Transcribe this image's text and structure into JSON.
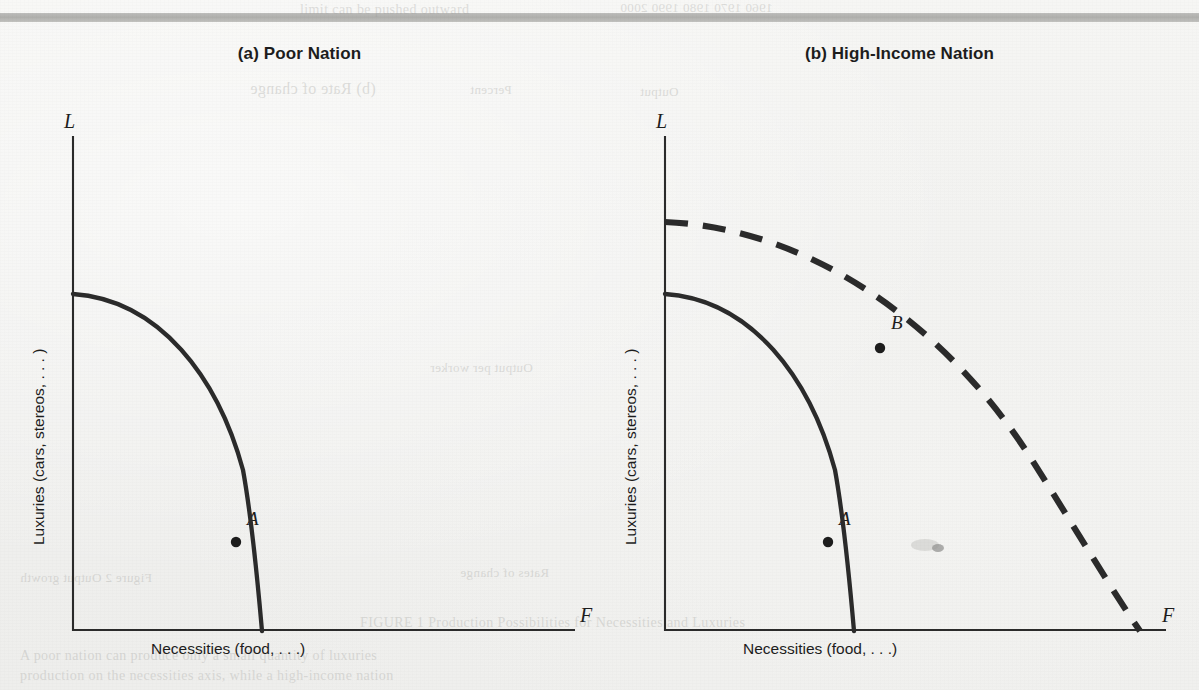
{
  "figure": {
    "kind": "production-possibilities-frontier",
    "background_color": "#f2f2f0",
    "ink_color": "#2b2b2b",
    "rule_color": "#b0b0ad"
  },
  "panels": [
    {
      "id": "a",
      "title": "(a) Poor Nation",
      "ylabel": "Luxuries (cars, stereos, . . . )",
      "xlabel": "Necessities (food, . . .)",
      "y_axis_letter": "L",
      "x_axis_letter": "F",
      "points": [
        {
          "label": "A",
          "on": "solid-curve"
        }
      ],
      "curves": [
        {
          "name": "current-ppf",
          "style": "solid"
        }
      ]
    },
    {
      "id": "b",
      "title": "(b) High-Income Nation",
      "ylabel": "Luxuries (cars, stereos, . . . )",
      "xlabel": "Necessities (food, . . .)",
      "y_axis_letter": "L",
      "x_axis_letter": "F",
      "points": [
        {
          "label": "A",
          "on": "solid-curve"
        },
        {
          "label": "B",
          "on": "dashed-curve"
        }
      ],
      "curves": [
        {
          "name": "current-ppf",
          "style": "solid"
        },
        {
          "name": "expanded-ppf",
          "style": "dashed"
        }
      ]
    }
  ],
  "chart_data": {
    "type": "line",
    "xlabel": "Necessities (food, . . .)",
    "ylabel": "Luxuries (cars, stereos, . . . )",
    "x_axis_symbol": "F",
    "y_axis_symbol": "L",
    "grid": false,
    "legend": "none",
    "xlim": [
      0,
      1
    ],
    "ylim": [
      0,
      1
    ],
    "panels": [
      {
        "panel": "(a) Poor Nation",
        "series": [
          {
            "name": "current-ppf",
            "style": "solid",
            "x_intercept": 0.42,
            "y_intercept": 0.66,
            "shape": "concave",
            "points_xy": [
              [
                0.0,
                0.66
              ],
              [
                0.06,
                0.655
              ],
              [
                0.12,
                0.64
              ],
              [
                0.18,
                0.61
              ],
              [
                0.24,
                0.565
              ],
              [
                0.3,
                0.5
              ],
              [
                0.355,
                0.4
              ],
              [
                0.39,
                0.29
              ],
              [
                0.41,
                0.16
              ],
              [
                0.42,
                0.0
              ]
            ]
          }
        ],
        "annotations": [
          {
            "label": "A",
            "x": 0.375,
            "y": 0.205,
            "marker": "filled-dot",
            "label_offset": "upper-right"
          }
        ]
      },
      {
        "panel": "(b) High-Income Nation",
        "series": [
          {
            "name": "current-ppf",
            "style": "solid",
            "x_intercept": 0.42,
            "y_intercept": 0.66,
            "shape": "concave",
            "points_xy": [
              [
                0.0,
                0.66
              ],
              [
                0.06,
                0.655
              ],
              [
                0.12,
                0.64
              ],
              [
                0.18,
                0.61
              ],
              [
                0.24,
                0.565
              ],
              [
                0.3,
                0.5
              ],
              [
                0.355,
                0.4
              ],
              [
                0.39,
                0.29
              ],
              [
                0.41,
                0.16
              ],
              [
                0.42,
                0.0
              ]
            ]
          },
          {
            "name": "expanded-ppf",
            "style": "dashed",
            "x_intercept": 0.99,
            "y_intercept": 0.8,
            "shape": "concave",
            "points_xy": [
              [
                0.0,
                0.8
              ],
              [
                0.12,
                0.79
              ],
              [
                0.24,
                0.765
              ],
              [
                0.36,
                0.72
              ],
              [
                0.48,
                0.655
              ],
              [
                0.6,
                0.575
              ],
              [
                0.72,
                0.47
              ],
              [
                0.82,
                0.355
              ],
              [
                0.9,
                0.235
              ],
              [
                0.96,
                0.1
              ],
              [
                0.99,
                0.0
              ]
            ]
          }
        ],
        "annotations": [
          {
            "label": "A",
            "x": 0.375,
            "y": 0.205,
            "marker": "filled-dot",
            "label_offset": "upper-right"
          },
          {
            "label": "B",
            "x": 0.465,
            "y": 0.565,
            "marker": "filled-dot",
            "label_offset": "upper-right"
          }
        ]
      }
    ]
  },
  "ghost_text": [
    {
      "text": "limit can be pushed outward",
      "x": 300,
      "y": 2,
      "size": 14,
      "flip": false
    },
    {
      "text": "1960 1970 1980 1990 2000",
      "x": 620,
      "y": 0,
      "size": 13,
      "flip": true
    },
    {
      "text": "(b) Rate of change",
      "x": 250,
      "y": 80,
      "size": 16,
      "flip": true
    },
    {
      "text": "Percent",
      "x": 470,
      "y": 82,
      "size": 13,
      "flip": true
    },
    {
      "text": "Output",
      "x": 640,
      "y": 84,
      "size": 13,
      "flip": true
    },
    {
      "text": "Output per worker",
      "x": 430,
      "y": 360,
      "size": 13,
      "flip": true
    },
    {
      "text": "Figure 2 Output growth",
      "x": 20,
      "y": 570,
      "size": 13,
      "flip": true
    },
    {
      "text": "Rates of change",
      "x": 460,
      "y": 565,
      "size": 13,
      "flip": true
    },
    {
      "text": "FIGURE 1  Production Possibilities for Necessities and Luxuries",
      "x": 360,
      "y": 615,
      "size": 14,
      "flip": false
    },
    {
      "text": "A poor nation can produce only a small quantity of luxuries",
      "x": 20,
      "y": 648,
      "size": 14,
      "flip": false
    },
    {
      "text": "production on the necessities axis, while a high-income nation",
      "x": 20,
      "y": 668,
      "size": 14,
      "flip": false
    }
  ]
}
